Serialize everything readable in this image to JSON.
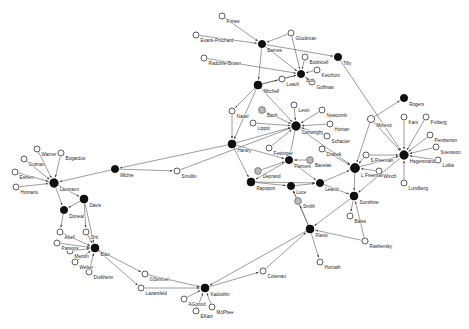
{
  "figure": {
    "type": "network-graph",
    "title": "",
    "width": 469,
    "height": 329,
    "background": "#ffffff",
    "edge_color": "#4a4a4a",
    "node_open_color": "#ffffff",
    "node_filled_color": "#101010",
    "node_grey_color": "#b9b9b9",
    "label_color": "#1c1c1c"
  },
  "chart_data": {
    "type": "network",
    "title": "",
    "directed": true,
    "node_styles": {
      "open": "unfilled white circle with dark outline",
      "filled": "solid black circle",
      "grey": "solid grey circle"
    },
    "nodes": [
      {
        "id": "Fortes",
        "label": "Fortes",
        "x": 222,
        "y": 16,
        "r": 3.0,
        "style": "open"
      },
      {
        "id": "EvansPritchard",
        "label": "Evans-Pritchard",
        "x": 196,
        "y": 35,
        "r": 3.0,
        "style": "open"
      },
      {
        "id": "Barnes",
        "label": "Barnes",
        "x": 262,
        "y": 44,
        "r": 3.6,
        "style": "filled"
      },
      {
        "id": "Gluckman",
        "label": "Gluckman",
        "x": 291,
        "y": 33,
        "r": 3.0,
        "style": "open"
      },
      {
        "id": "RadcliffeBrown",
        "label": "Radcliffe-Brown",
        "x": 204,
        "y": 58,
        "r": 3.0,
        "style": "open"
      },
      {
        "id": "Bodnicell",
        "label": "Bodnicell",
        "x": 305,
        "y": 57,
        "r": 3.0,
        "style": "open"
      },
      {
        "id": "Tilly",
        "label": "Tilly",
        "x": 338,
        "y": 57,
        "r": 3.6,
        "style": "filled"
      },
      {
        "id": "Ketchum",
        "label": "Ketchum",
        "x": 317,
        "y": 70,
        "r": 3.0,
        "style": "open"
      },
      {
        "id": "Bott",
        "label": "Bott",
        "x": 301,
        "y": 74,
        "r": 3.6,
        "style": "filled"
      },
      {
        "id": "Goffman",
        "label": "Goffman",
        "x": 312,
        "y": 82,
        "r": 3.0,
        "style": "open"
      },
      {
        "id": "Leach",
        "label": "Leach",
        "x": 282,
        "y": 79,
        "r": 3.0,
        "style": "open"
      },
      {
        "id": "Mitchell",
        "label": "Mitchell",
        "x": 258,
        "y": 85,
        "r": 3.9,
        "style": "filled"
      },
      {
        "id": "Nadel",
        "label": "Nadel",
        "x": 232,
        "y": 111,
        "r": 3.0,
        "style": "open"
      },
      {
        "id": "Bach",
        "label": "Bach",
        "x": 262,
        "y": 110,
        "r": 3.4,
        "style": "grey"
      },
      {
        "id": "Levin",
        "label": "Levin",
        "x": 294,
        "y": 105,
        "r": 3.0,
        "style": "open"
      },
      {
        "id": "Newcomb",
        "label": "Newcomb",
        "x": 322,
        "y": 110,
        "r": 3.0,
        "style": "open"
      },
      {
        "id": "Lippitt",
        "label": "Lippitt",
        "x": 253,
        "y": 123,
        "r": 3.0,
        "style": "open"
      },
      {
        "id": "Cartwright",
        "label": "Cartwright",
        "x": 296,
        "y": 126,
        "r": 4.2,
        "style": "filled"
      },
      {
        "id": "Homan",
        "label": "Homan",
        "x": 330,
        "y": 124,
        "r": 3.0,
        "style": "open"
      },
      {
        "id": "Schacter",
        "label": "Schacter",
        "x": 327,
        "y": 136,
        "r": 3.0,
        "style": "open"
      },
      {
        "id": "Moreno",
        "label": "Moreno",
        "x": 371,
        "y": 119,
        "r": 3.6,
        "style": "open"
      },
      {
        "id": "Rogers",
        "label": "Rogers",
        "x": 404,
        "y": 98,
        "r": 3.6,
        "style": "filled"
      },
      {
        "id": "Kant",
        "label": "Kant",
        "x": 404,
        "y": 117,
        "r": 3.0,
        "style": "open"
      },
      {
        "id": "Froberg",
        "label": "Froberg",
        "x": 426,
        "y": 117,
        "r": 3.0,
        "style": "open"
      },
      {
        "id": "Pemberton",
        "label": "Pemberton",
        "x": 430,
        "y": 135,
        "r": 3.0,
        "style": "open"
      },
      {
        "id": "Svensson",
        "label": "Svensson",
        "x": 436,
        "y": 147,
        "r": 3.0,
        "style": "open"
      },
      {
        "id": "Lotka",
        "label": "Lotka",
        "x": 438,
        "y": 160,
        "r": 3.0,
        "style": "open"
      },
      {
        "id": "Hagerstrand",
        "label": "Hagerstrand",
        "x": 404,
        "y": 155,
        "r": 4.2,
        "style": "filled"
      },
      {
        "id": "Harary",
        "label": "Harary",
        "x": 232,
        "y": 144,
        "r": 3.9,
        "style": "filled"
      },
      {
        "id": "Festinger",
        "label": "Festinger",
        "x": 269,
        "y": 148,
        "r": 3.0,
        "style": "open"
      },
      {
        "id": "Drabek",
        "label": "Drabek",
        "x": 322,
        "y": 149,
        "r": 3.0,
        "style": "open"
      },
      {
        "id": "Deprand",
        "label": "Deprand",
        "x": 258,
        "y": 171,
        "r": 3.4,
        "style": "grey"
      },
      {
        "id": "Flament",
        "label": "Flament",
        "x": 289,
        "y": 160,
        "r": 3.6,
        "style": "filled"
      },
      {
        "id": "Bavelas",
        "label": "Bavelas",
        "x": 310,
        "y": 160,
        "r": 3.4,
        "style": "grey"
      },
      {
        "id": "SFreeman",
        "label": "S.Freeman",
        "x": 366,
        "y": 155,
        "r": 3.0,
        "style": "open"
      },
      {
        "id": "LFreeman",
        "label": "L.Freeman",
        "x": 355,
        "y": 168,
        "r": 4.5,
        "style": "filled"
      },
      {
        "id": "Winch",
        "label": "Winch",
        "x": 379,
        "y": 171,
        "r": 3.0,
        "style": "open"
      },
      {
        "id": "Lundberg",
        "label": "Lundberg",
        "x": 404,
        "y": 183,
        "r": 3.0,
        "style": "open"
      },
      {
        "id": "Rapoport",
        "label": "Rapoport",
        "x": 251,
        "y": 182,
        "r": 3.9,
        "style": "filled"
      },
      {
        "id": "Luce",
        "label": "Luce",
        "x": 291,
        "y": 186,
        "r": 3.6,
        "style": "filled"
      },
      {
        "id": "Leavitt",
        "label": "Leavitt",
        "x": 320,
        "y": 183,
        "r": 3.6,
        "style": "filled"
      },
      {
        "id": "Smith",
        "label": "Smith",
        "x": 298,
        "y": 201,
        "r": 3.4,
        "style": "grey"
      },
      {
        "id": "Sunshine",
        "label": "Sunshine",
        "x": 354,
        "y": 196,
        "r": 3.9,
        "style": "filled"
      },
      {
        "id": "Bales",
        "label": "Bales",
        "x": 350,
        "y": 216,
        "r": 3.0,
        "style": "open"
      },
      {
        "id": "Rashevsky",
        "label": "Rashevsky",
        "x": 365,
        "y": 241,
        "r": 3.0,
        "style": "open"
      },
      {
        "id": "Flavio",
        "label": "Flavio",
        "x": 310,
        "y": 229,
        "r": 3.9,
        "style": "filled"
      },
      {
        "id": "Horvath",
        "label": "Horvath",
        "x": 320,
        "y": 262,
        "r": 3.0,
        "style": "open"
      },
      {
        "id": "Michie",
        "label": "Michie",
        "x": 115,
        "y": 169,
        "r": 3.6,
        "style": "filled"
      },
      {
        "id": "Smullin",
        "label": "Smullin",
        "x": 177,
        "y": 171,
        "r": 3.0,
        "style": "open"
      },
      {
        "id": "Warner",
        "label": "Warner",
        "x": 37,
        "y": 149,
        "r": 3.0,
        "style": "open"
      },
      {
        "id": "Bogardus",
        "label": "Bogardus",
        "x": 61,
        "y": 153,
        "r": 3.0,
        "style": "open"
      },
      {
        "id": "Gutman",
        "label": "Gutman",
        "x": 24,
        "y": 159,
        "r": 3.0,
        "style": "open"
      },
      {
        "id": "Eshern",
        "label": "Eshern",
        "x": 15,
        "y": 172,
        "r": 3.0,
        "style": "open"
      },
      {
        "id": "Homans",
        "label": "Homans",
        "x": 16,
        "y": 187,
        "r": 3.0,
        "style": "open"
      },
      {
        "id": "Laumann",
        "label": "Laumann",
        "x": 54,
        "y": 183,
        "r": 4.2,
        "style": "filled"
      },
      {
        "id": "Davis",
        "label": "Davis",
        "x": 84,
        "y": 199,
        "r": 3.9,
        "style": "filled"
      },
      {
        "id": "Doneal",
        "label": "Doneal",
        "x": 64,
        "y": 210,
        "r": 3.6,
        "style": "filled"
      },
      {
        "id": "Abell",
        "label": "Abell",
        "x": 60,
        "y": 232,
        "r": 3.0,
        "style": "open"
      },
      {
        "id": "Orti",
        "label": "Orti",
        "x": 86,
        "y": 232,
        "r": 3.0,
        "style": "open"
      },
      {
        "id": "Parsons",
        "label": "Parsons",
        "x": 57,
        "y": 243,
        "r": 3.0,
        "style": "open"
      },
      {
        "id": "Merton",
        "label": "Merton",
        "x": 70,
        "y": 251,
        "r": 3.0,
        "style": "open"
      },
      {
        "id": "Weber",
        "label": "Weber",
        "x": 75,
        "y": 262,
        "r": 3.0,
        "style": "open"
      },
      {
        "id": "Durkheim",
        "label": "Durkheim",
        "x": 89,
        "y": 272,
        "r": 3.0,
        "style": "open"
      },
      {
        "id": "Blau",
        "label": "Blau",
        "x": 95,
        "y": 248,
        "r": 3.9,
        "style": "filled"
      },
      {
        "id": "GSimmel",
        "label": "GSimmel",
        "x": 145,
        "y": 274,
        "r": 3.0,
        "style": "open"
      },
      {
        "id": "Lazarsfeld",
        "label": "Lazarsfeld",
        "x": 141,
        "y": 288,
        "r": 3.0,
        "style": "open"
      },
      {
        "id": "Kadushin",
        "label": "Kadushin",
        "x": 205,
        "y": 288,
        "r": 3.9,
        "style": "filled"
      },
      {
        "id": "AGonod",
        "label": "AGonod",
        "x": 184,
        "y": 299,
        "r": 3.0,
        "style": "open"
      },
      {
        "id": "EKatz",
        "label": "EKatz",
        "x": 196,
        "y": 311,
        "r": 3.0,
        "style": "open"
      },
      {
        "id": "McPhee",
        "label": "McPhee",
        "x": 212,
        "y": 307,
        "r": 3.0,
        "style": "open"
      },
      {
        "id": "Coleman",
        "label": "Coleman",
        "x": 263,
        "y": 271,
        "r": 3.0,
        "style": "open"
      }
    ],
    "edges": [
      {
        "source": "Fortes",
        "target": "Barnes"
      },
      {
        "source": "EvansPritchard",
        "target": "Barnes"
      },
      {
        "source": "Gluckman",
        "target": "Barnes"
      },
      {
        "source": "Gluckman",
        "target": "Bott"
      },
      {
        "source": "Barnes",
        "target": "Bott"
      },
      {
        "source": "Barnes",
        "target": "Mitchell"
      },
      {
        "source": "Barnes",
        "target": "Tilly"
      },
      {
        "source": "RadcliffeBrown",
        "target": "Bott"
      },
      {
        "source": "Bodnicell",
        "target": "Bott"
      },
      {
        "source": "Ketchum",
        "target": "Bott"
      },
      {
        "source": "Goffman",
        "target": "Bott"
      },
      {
        "source": "Leach",
        "target": "Bott"
      },
      {
        "source": "Mitchell",
        "target": "Bott"
      },
      {
        "source": "Mitchell",
        "target": "Leach"
      },
      {
        "source": "Tilly",
        "target": "Hagerstrand"
      },
      {
        "source": "Mitchell",
        "target": "Nadel"
      },
      {
        "source": "Mitchell",
        "target": "Harary"
      },
      {
        "source": "Mitchell",
        "target": "Cartwright"
      },
      {
        "source": "Nadel",
        "target": "Harary"
      },
      {
        "source": "Bach",
        "target": "Cartwright"
      },
      {
        "source": "Levin",
        "target": "Cartwright"
      },
      {
        "source": "Newcomb",
        "target": "Cartwright"
      },
      {
        "source": "Lippitt",
        "target": "Cartwright"
      },
      {
        "source": "Homan",
        "target": "Cartwright"
      },
      {
        "source": "Schacter",
        "target": "Cartwright"
      },
      {
        "source": "Harary",
        "target": "Cartwright"
      },
      {
        "source": "Festinger",
        "target": "Cartwright"
      },
      {
        "source": "Cartwright",
        "target": "Flament"
      },
      {
        "source": "Cartwright",
        "target": "LFreeman"
      },
      {
        "source": "Harary",
        "target": "Flament"
      },
      {
        "source": "Harary",
        "target": "Rapoport"
      },
      {
        "source": "Deprand",
        "target": "Flament"
      },
      {
        "source": "Bavelas",
        "target": "Flament"
      },
      {
        "source": "Flament",
        "target": "Rapoport"
      },
      {
        "source": "Flament",
        "target": "Leavitt"
      },
      {
        "source": "Rapoport",
        "target": "Luce"
      },
      {
        "source": "Rapoport",
        "target": "Leavitt"
      },
      {
        "source": "Luce",
        "target": "Leavitt"
      },
      {
        "source": "Smith",
        "target": "Luce"
      },
      {
        "source": "Leavitt",
        "target": "Sunshine"
      },
      {
        "source": "Leavitt",
        "target": "LFreeman"
      },
      {
        "source": "Drabek",
        "target": "LFreeman"
      },
      {
        "source": "Moreno",
        "target": "LFreeman"
      },
      {
        "source": "Moreno",
        "target": "Rogers"
      },
      {
        "source": "Moreno",
        "target": "Hagerstrand"
      },
      {
        "source": "SFreeman",
        "target": "LFreeman"
      },
      {
        "source": "SFreeman",
        "target": "Hagerstrand"
      },
      {
        "source": "Winch",
        "target": "LFreeman"
      },
      {
        "source": "LFreeman",
        "target": "Hagerstrand"
      },
      {
        "source": "LFreeman",
        "target": "Sunshine"
      },
      {
        "source": "Kant",
        "target": "Hagerstrand"
      },
      {
        "source": "Froberg",
        "target": "Hagerstrand"
      },
      {
        "source": "Pemberton",
        "target": "Hagerstrand"
      },
      {
        "source": "Svensson",
        "target": "Hagerstrand"
      },
      {
        "source": "Lotka",
        "target": "Hagerstrand"
      },
      {
        "source": "Lundberg",
        "target": "Hagerstrand"
      },
      {
        "source": "Hagerstrand",
        "target": "Sunshine"
      },
      {
        "source": "Sunshine",
        "target": "Bales"
      },
      {
        "source": "Sunshine",
        "target": "Flavio"
      },
      {
        "source": "Rashevsky",
        "target": "Sunshine"
      },
      {
        "source": "Rashevsky",
        "target": "Flavio"
      },
      {
        "source": "Flavio",
        "target": "Horvath"
      },
      {
        "source": "Flavio",
        "target": "Luce"
      },
      {
        "source": "Flavio",
        "target": "Smith"
      },
      {
        "source": "Flavio",
        "target": "Kadushin"
      },
      {
        "source": "Harary",
        "target": "Michie"
      },
      {
        "source": "Michie",
        "target": "Smullin"
      },
      {
        "source": "Michie",
        "target": "Laumann"
      },
      {
        "source": "Smullin",
        "target": "Cartwright"
      },
      {
        "source": "Warner",
        "target": "Laumann"
      },
      {
        "source": "Bogardus",
        "target": "Laumann"
      },
      {
        "source": "Gutman",
        "target": "Laumann"
      },
      {
        "source": "Eshern",
        "target": "Laumann"
      },
      {
        "source": "Homans",
        "target": "Laumann"
      },
      {
        "source": "Laumann",
        "target": "Davis"
      },
      {
        "source": "Laumann",
        "target": "Doneal"
      },
      {
        "source": "Davis",
        "target": "Doneal"
      },
      {
        "source": "Davis",
        "target": "Orti"
      },
      {
        "source": "Davis",
        "target": "Blau"
      },
      {
        "source": "Doneal",
        "target": "Abell"
      },
      {
        "source": "Abell",
        "target": "Blau"
      },
      {
        "source": "Orti",
        "target": "Blau"
      },
      {
        "source": "Parsons",
        "target": "Blau"
      },
      {
        "source": "Merton",
        "target": "Blau"
      },
      {
        "source": "Weber",
        "target": "Blau"
      },
      {
        "source": "Durkheim",
        "target": "Blau"
      },
      {
        "source": "Blau",
        "target": "GSimmel"
      },
      {
        "source": "Blau",
        "target": "Lazarsfeld"
      },
      {
        "source": "GSimmel",
        "target": "Kadushin"
      },
      {
        "source": "Lazarsfeld",
        "target": "Kadushin"
      },
      {
        "source": "AGonod",
        "target": "Kadushin"
      },
      {
        "source": "EKatz",
        "target": "Kadushin"
      },
      {
        "source": "McPhee",
        "target": "Kadushin"
      },
      {
        "source": "Kadushin",
        "target": "Coleman"
      },
      {
        "source": "Coleman",
        "target": "Flavio"
      }
    ]
  }
}
